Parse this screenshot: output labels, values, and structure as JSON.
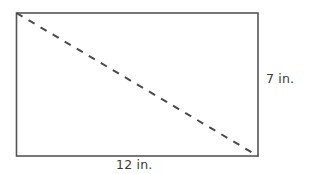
{
  "figure": {
    "shape_name": "rectangle-with-diagonal",
    "stroke_color": "#555555",
    "diagonal_color": "#4a4a4a",
    "background_color": "#ffffff",
    "text_color": "#3a3a3a",
    "rectangle": {
      "x": 16.5,
      "y": 13,
      "width": 241.5,
      "height": 143,
      "stroke_width": 1.6
    },
    "diagonal": {
      "x1": 16.5,
      "y1": 13,
      "x2": 258,
      "y2": 156,
      "stroke_width": 2,
      "dash_pattern": "7 7"
    },
    "labels": {
      "height": "7 in.",
      "width": "12 in."
    }
  },
  "chart_data": {
    "type": "diagram",
    "title": "",
    "shape": "rectangle",
    "dimensions": [
      {
        "side": "width",
        "value": 12,
        "unit": "in.",
        "label": "12 in.",
        "position": "bottom"
      },
      {
        "side": "height",
        "value": 7,
        "unit": "in.",
        "label": "7 in.",
        "position": "right"
      }
    ],
    "annotations": [
      {
        "name": "diagonal",
        "style": "dashed",
        "from": "top-left",
        "to": "bottom-right",
        "label": ""
      }
    ]
  }
}
